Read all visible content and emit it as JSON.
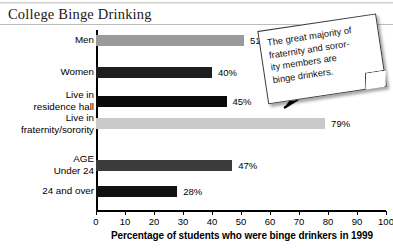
{
  "title": "College Binge Drinking",
  "chart_data": {
    "type": "bar",
    "orientation": "horizontal",
    "title": "College Binge Drinking",
    "xlabel": "Percentage of students who were binge drinkers in 1999",
    "ylabel": "",
    "xlim": [
      0,
      100
    ],
    "xticks": [
      0,
      10,
      20,
      30,
      40,
      50,
      60,
      70,
      80,
      90,
      100
    ],
    "grid": false,
    "legend": null,
    "categories": [
      "Men",
      "Women",
      "Live in\nresidence hall",
      "Live in\nfraternity/sorority",
      "Under 24",
      "24 and over"
    ],
    "values": [
      51,
      40,
      45,
      79,
      47,
      28
    ],
    "value_labels": [
      "51%",
      "40%",
      "45%",
      "79%",
      "47%",
      "28%"
    ],
    "bar_colors": [
      "#9a9a9a",
      "#1f1f1f",
      "#0a0a0a",
      "#c9c9c9",
      "#3b3b3b",
      "#111111"
    ],
    "group_headers": [
      {
        "label": "AGE",
        "before_category_index": 4
      }
    ],
    "annotations": [
      {
        "text": "The great majority of fraternity and soror-\nity members are binge drinkers.",
        "points_to_category": "Live in fraternity/sorority",
        "points_to_value": 79,
        "style": "tilted-note-with-arrow"
      }
    ]
  },
  "note": {
    "text": "The great majority of\nfraternity and soror-\nity members are\nbinge drinkers."
  },
  "axis": {
    "caption": "Percentage of students who were binge drinkers in 1999"
  }
}
